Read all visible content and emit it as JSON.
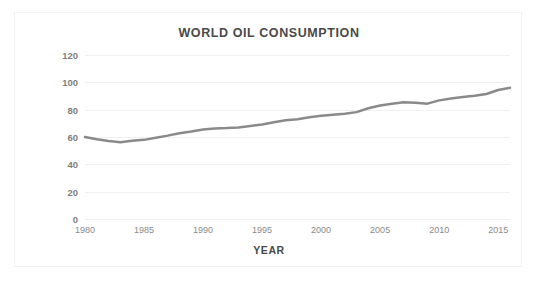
{
  "chart_data": {
    "type": "line",
    "title": "WORLD OIL CONSUMPTION",
    "xlabel": "YEAR",
    "ylabel": "MILLON BARRELS OIL/DAY",
    "xlim": [
      1980,
      2016
    ],
    "ylim": [
      0,
      120
    ],
    "x_ticks": [
      1980,
      1985,
      1990,
      1995,
      2000,
      2005,
      2010,
      2015
    ],
    "y_ticks": [
      0,
      20,
      40,
      60,
      80,
      100,
      120
    ],
    "grid": "horizontal",
    "legend": "none",
    "line_color": "#8a8a8a",
    "line_width": 2.5,
    "series": [
      {
        "name": "World oil consumption",
        "x": [
          1980,
          1981,
          1982,
          1983,
          1984,
          1985,
          1986,
          1987,
          1988,
          1989,
          1990,
          1991,
          1992,
          1993,
          1994,
          1995,
          1996,
          1997,
          1998,
          1999,
          2000,
          2001,
          2002,
          2003,
          2004,
          2005,
          2006,
          2007,
          2008,
          2009,
          2010,
          2011,
          2012,
          2013,
          2014,
          2015,
          2016
        ],
        "values": [
          60.0,
          58.3,
          57.0,
          56.2,
          57.2,
          57.9,
          59.5,
          61.0,
          62.8,
          64.0,
          65.5,
          66.3,
          66.5,
          66.9,
          68.0,
          69.2,
          70.8,
          72.2,
          73.0,
          74.5,
          75.6,
          76.3,
          77.0,
          78.2,
          81.0,
          83.0,
          84.3,
          85.5,
          85.0,
          84.4,
          86.8,
          88.1,
          89.3,
          90.2,
          91.5,
          94.4,
          96.0
        ]
      }
    ],
    "notes": {
      "start_value": 60.0,
      "minimum_value": 56.2,
      "minimum_year": 1983,
      "end_value": 96.0,
      "end_year": 2016
    }
  },
  "figure": {
    "background_color": "#ffffff",
    "frame_color": "#f2f2f2",
    "title_color": "#4a4a4a",
    "tick_color": "#808080"
  }
}
